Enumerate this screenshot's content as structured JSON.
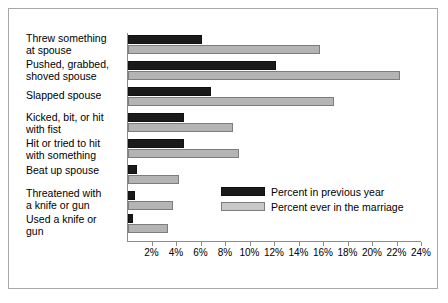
{
  "chart_data": {
    "type": "bar",
    "orientation": "horizontal",
    "title": "",
    "subtitle": "",
    "xlabel": "",
    "ylabel": "",
    "xlim": [
      0,
      24
    ],
    "xticks": [
      2,
      4,
      6,
      8,
      10,
      12,
      14,
      16,
      18,
      20,
      22,
      24
    ],
    "xtick_labels": [
      "2%",
      "4%",
      "6%",
      "8%",
      "10%",
      "12%",
      "14%",
      "16%",
      "18%",
      "20%",
      "22%",
      "24%"
    ],
    "grid": false,
    "legend_position": "lower-right",
    "categories": [
      "Threw something\nat spouse",
      "Pushed, grabbed,\nshoved spouse",
      "Slapped spouse",
      "Kicked, bit, or hit\nwith fist",
      "Hit or tried to hit\nwith something",
      "Beat up spouse",
      "Threatened with\na knife or gun",
      "Used a knife or\ngun"
    ],
    "series": [
      {
        "name": "Percent in previous year",
        "color": "#1a1a1a",
        "values": [
          6.0,
          12.1,
          6.8,
          4.6,
          4.6,
          0.7,
          0.6,
          0.4
        ]
      },
      {
        "name": "Percent ever in the marriage",
        "color": "#b4b4b4",
        "values": [
          15.7,
          22.2,
          16.8,
          8.6,
          9.1,
          4.2,
          3.7,
          3.3
        ]
      }
    ],
    "legend": [
      "Percent in previous year",
      "Percent ever in the marriage"
    ]
  }
}
